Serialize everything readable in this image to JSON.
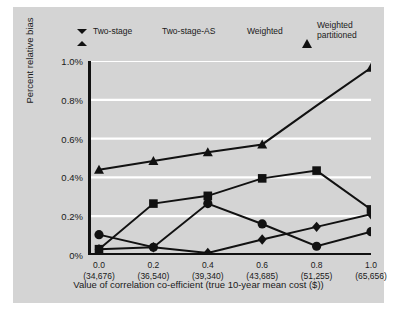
{
  "chart_data": {
    "type": "line",
    "title": "",
    "xlabel": "Value of correlation co-efficient (true 10-year mean cost ($))",
    "ylabel": "Percent relative bias",
    "x": [
      0.0,
      0.2,
      0.4,
      0.6,
      0.8,
      1.0
    ],
    "categories": [
      "0.0",
      "0.2",
      "0.4",
      "0.6",
      "0.8",
      "1.0"
    ],
    "x_sublabels": [
      "(34,676)",
      "(36,540)",
      "(39,340)",
      "(43,685)",
      "(51,255)",
      "(65,656)"
    ],
    "ylim": [
      0.0,
      1.0
    ],
    "ytick_labels": [
      "0%",
      "0.2%",
      "0.4%",
      "0.6%",
      "0.8%",
      "1.0%"
    ],
    "ytick_values": [
      0.0,
      0.2,
      0.4,
      0.6,
      0.8,
      1.0
    ],
    "grid": "horizontal-white",
    "legend_position": "top",
    "series": [
      {
        "name": "Two-stage",
        "marker": "diamond",
        "values": [
          0.03,
          0.04,
          0.01,
          0.08,
          0.145,
          0.21
        ]
      },
      {
        "name": "Two-stage-AS",
        "marker": "circle",
        "values": [
          0.105,
          0.04,
          0.265,
          0.16,
          0.045,
          0.12
        ]
      },
      {
        "name": "Weighted",
        "marker": "square",
        "values": [
          0.03,
          0.265,
          0.305,
          0.395,
          0.435,
          0.235
        ]
      },
      {
        "name": "Weighted partitioned",
        "marker": "triangle",
        "values": [
          0.44,
          0.485,
          0.53,
          0.57,
          0.77,
          0.965
        ]
      }
    ]
  },
  "legend": {
    "items": [
      {
        "label": "Two-stage",
        "marker": "diamond"
      },
      {
        "label": "Two-stage-AS",
        "marker": "circle"
      },
      {
        "label": "Weighted",
        "marker": "square"
      },
      {
        "label": "Weighted\npartitioned",
        "marker": "triangle"
      }
    ]
  },
  "colors": {
    "panel": "#d4d4d4",
    "series": "#111111",
    "gridline": "#ffffff",
    "axis": "#111111",
    "text": "#1a1a1a"
  }
}
